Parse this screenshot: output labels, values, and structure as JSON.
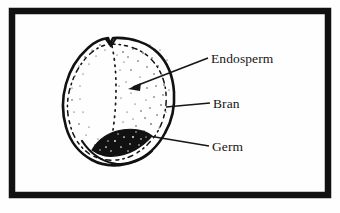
{
  "figure": {
    "background_color": "#fefefe",
    "border_color": "#111111",
    "ink_color": "#161616",
    "title": "",
    "frame": {
      "x": 9,
      "y": 8,
      "width": 322,
      "height": 190,
      "thickness": 6
    }
  },
  "diagram": {
    "parts": [
      {
        "id": "endosperm",
        "label": "Endosperm",
        "leader": "arrow",
        "anchor_x": 130,
        "anchor_y": 88
      },
      {
        "id": "bran",
        "label": "Bran",
        "leader": "line",
        "anchor_x": 167,
        "anchor_y": 106
      },
      {
        "id": "germ",
        "label": "Germ",
        "leader": "line",
        "anchor_x": 139,
        "anchor_y": 135
      }
    ],
    "outline_color": "#111111",
    "germ_fill_color": "#111111",
    "interior_fill_color": "#fefefe"
  },
  "labels": {
    "endosperm": "Endosperm",
    "bran": "Bran",
    "germ": "Germ"
  }
}
